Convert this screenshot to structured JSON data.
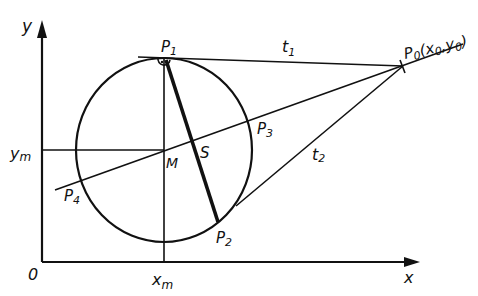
{
  "diagram": {
    "type": "geometry",
    "axes": {
      "x_label": "x",
      "y_label": "y",
      "origin_label": "0"
    },
    "labels": {
      "y_axis": "y",
      "x_axis": "x",
      "origin": "0",
      "ym": "y",
      "ym_sub": "m",
      "xm": "x",
      "xm_sub": "m",
      "center": "M",
      "s_point": "S",
      "p1": "P",
      "p1_sub": "1",
      "p2": "P",
      "p2_sub": "2",
      "p3": "P",
      "p3_sub": "3",
      "p4": "P",
      "p4_sub": "4",
      "p0": "P",
      "p0_sub": "0",
      "p0_coords_open": "(x",
      "p0_coords_x_sub": "0",
      "p0_coords_sep": ",y",
      "p0_coords_y_sub": "0",
      "p0_coords_close": ")",
      "t1": "t",
      "t1_sub": "1",
      "t2": "t",
      "t2_sub": "2"
    },
    "points": {
      "M": [
        164,
        150
      ],
      "P0": [
        403,
        66
      ],
      "P1": [
        164,
        58
      ],
      "P2": [
        218,
        222
      ],
      "P3": [
        252,
        117
      ],
      "P4": [
        80,
        180
      ],
      "S": [
        192,
        140
      ]
    }
  }
}
